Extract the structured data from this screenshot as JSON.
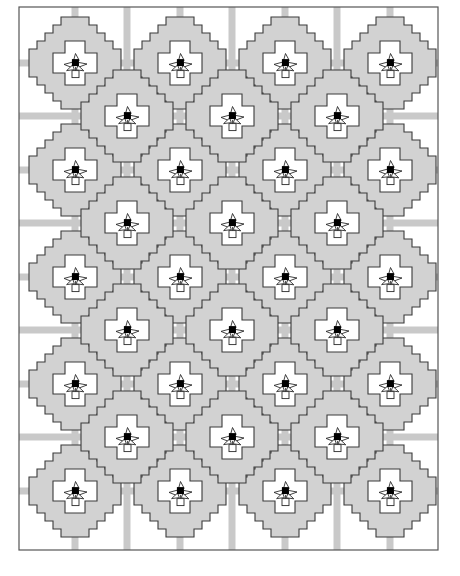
{
  "figure": {
    "kind": "quilt-pattern-schematic",
    "canvas": {
      "width": 460,
      "height": 576
    },
    "background_color": "#ffffff"
  },
  "colors": {
    "background": "#ffffff",
    "patch_fill": "#d2d2d2",
    "patch_fill_light": "#dcdcdc",
    "sashing_fill": "#c9c9c9",
    "outline": "#3a3a3a",
    "frame_stroke": "#555555",
    "motif_center": "#000000",
    "motif_stroke": "#2b2b2b"
  },
  "frame": {
    "name": "quilt-outer-border",
    "x": 19,
    "y": 7,
    "width": 419,
    "height": 543,
    "stroke_width": 1.2
  },
  "layout": {
    "description": "Offset lattice: 4 columns of 5 blocks on the primary grid, plus 3 columns of 4 blocks on the half-step offset grid.",
    "block_size": 96,
    "column_spacing": 105,
    "row_spacing": 107,
    "primary_centers_x": [
      75,
      180,
      285,
      390
    ],
    "primary_centers_y": [
      63,
      170,
      277,
      384,
      491
    ],
    "offset_centers_x": [
      127,
      232,
      337
    ],
    "offset_centers_y": [
      116,
      223,
      330,
      437
    ],
    "primary_block_count": 20,
    "offset_block_count": 12,
    "total_block_count": 32
  },
  "block": {
    "name": "stepped-octagon-block",
    "shape": "stair-stepped octagon (attic-window / snowball style) with notched white cross at center",
    "step_count": 5,
    "step_size": 8,
    "half_extent": 46,
    "inner_white_half_extent": 22,
    "outline_width": 1.1
  },
  "sashing": {
    "name": "sashing-strip",
    "width": 7,
    "orientation": "horizontal and vertical bands through every block center",
    "fill": "#c9c9c9"
  },
  "motif": {
    "name": "bird-flower-motif",
    "description": "Stylized appliqued bird / flower with angled petals, a small square stem box below and a solid black square body",
    "center_square_size": 7,
    "center_square_color": "#000000",
    "stem_box_size": 7,
    "stroke_width": 0.9,
    "occurrences": 32
  },
  "chart_data": {
    "type": "table",
    "categories": [
      "Primary grid columns",
      "Primary grid rows",
      "Offset grid columns",
      "Offset grid rows"
    ],
    "values": [
      4,
      5,
      3,
      4
    ]
  }
}
